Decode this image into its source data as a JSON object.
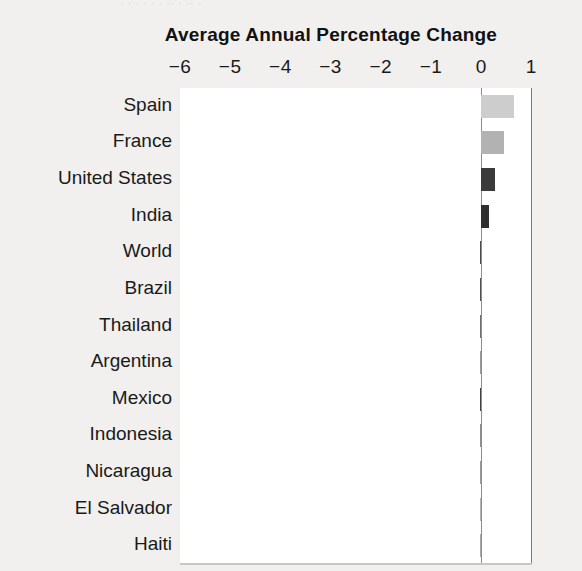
{
  "page": {
    "top_clipped_text": "· ·  · ·   · ·  ·· ·   ·· ·",
    "background_color": "#f1f0ee",
    "plot_background_color": "#ffffff"
  },
  "chart_data": {
    "type": "bar",
    "orientation": "horizontal",
    "title": "Average Annual Percentage Change",
    "xlabel": "",
    "ylabel": "",
    "xlim": [
      -6.4,
      1.05
    ],
    "grid": true,
    "legend": null,
    "xticks": [
      -6,
      -5,
      -4,
      -3,
      -2,
      -1,
      0,
      1
    ],
    "xtick_labels": [
      "−6",
      "−5",
      "−4",
      "−3",
      "−2",
      "−1",
      "0",
      "1"
    ],
    "categories": [
      "Spain",
      "France",
      "United States",
      "India",
      "World",
      "Brazil",
      "Thailand",
      "Argentina",
      "Mexico",
      "Indonesia",
      "Nicaragua",
      "El Salvador",
      "Haiti"
    ],
    "values": [
      0.65,
      0.45,
      0.28,
      0.15,
      -0.2,
      -0.4,
      -0.65,
      -0.8,
      -1.1,
      -1.2,
      -3.0,
      -4.6,
      -5.7
    ],
    "bar_colors": [
      "#cdcdcd",
      "#b2b2b2",
      "#3b3b3b",
      "#2f2f2f",
      "#4a4a4a",
      "#525252",
      "#6f6f6f",
      "#9a9a9a",
      "#414141",
      "#8e8e8e",
      "#9a9a9a",
      "#b3b3b3",
      "#a9a9a9"
    ]
  }
}
